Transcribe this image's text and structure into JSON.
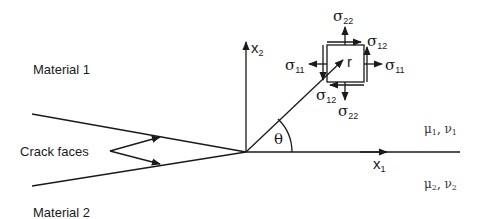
{
  "diagram": {
    "materials": {
      "top_label": "Material 1",
      "bottom_label": "Material 2",
      "top_props": {
        "mu": "μ",
        "mu_sub": "1",
        "nu": "ν",
        "nu_sub": "1",
        "sep": ", "
      },
      "bottom_props": {
        "mu": "μ",
        "mu_sub": "2",
        "nu": "ν",
        "nu_sub": "2",
        "sep": ", "
      }
    },
    "crack": {
      "label": "Crack faces"
    },
    "axes": {
      "x1": {
        "base": "x",
        "sub": "1"
      },
      "x2": {
        "base": "x",
        "sub": "2"
      },
      "radius": "r",
      "angle": "θ"
    },
    "stresses": {
      "sigma": "σ",
      "s22_top": "22",
      "s22_bottom": "22",
      "s12_top": "12",
      "s12_bottom": "12",
      "s11_left": "11",
      "s11_right": "11"
    },
    "colors": {
      "line": "#1a1a1a",
      "background": "#ffffff"
    }
  }
}
